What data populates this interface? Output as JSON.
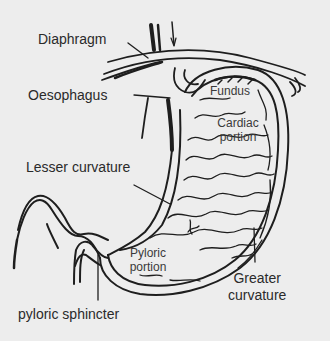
{
  "diagram": {
    "labels": {
      "diaphragm": "Diaphragm",
      "oesophagus": "Oesophagus",
      "lesser_curvature": "Lesser curvature",
      "pyloric_sphincter": "pyloric sphincter",
      "fundus": "Fundus",
      "cardiac_portion_line1": "Cardiac",
      "cardiac_portion_line2": "portion",
      "pyloric_portion_line1": "Pyloric",
      "pyloric_portion_line2": "portion",
      "greater_curvature_line1": "Greater",
      "greater_curvature_line2": "curvature"
    },
    "colors": {
      "background": "#ededed",
      "ink": "#1e1e1e",
      "label_text": "#2a2a2a"
    }
  }
}
